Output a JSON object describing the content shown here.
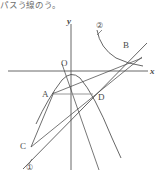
{
  "header": {
    "text": "パスう線のう。"
  },
  "figure": {
    "axes": {
      "x_label": "x",
      "y_label": "y",
      "origin_label": "O",
      "x_axis": {
        "x1": 8,
        "y1": 71,
        "x2": 148,
        "y2": 71
      },
      "y_axis": {
        "x1": 71,
        "y1": 24,
        "x2": 71,
        "y2": 170
      },
      "origin": {
        "x": 71,
        "y": 71
      }
    },
    "points": [
      {
        "name": "A",
        "label": "A",
        "x": 52,
        "y": 94,
        "label_x": 43,
        "label_y": 96
      },
      {
        "name": "B",
        "label": "B",
        "x": 131,
        "y": 52,
        "label_x": 124,
        "label_y": 47
      },
      {
        "name": "C",
        "label": "C",
        "x": 31,
        "y": 147,
        "label_x": 21,
        "label_y": 148
      },
      {
        "name": "D",
        "label": "D",
        "x": 93,
        "y": 94,
        "label_x": 99,
        "label_y": 99
      },
      {
        "name": "O",
        "label": "O",
        "x": 71,
        "y": 71,
        "label_x": 61,
        "label_y": 66
      }
    ],
    "curves": [
      {
        "name": "parabola",
        "kind": "downward-parabola",
        "path": "M 36,124 Q 48,98 62,80 Q 71,70 80,78 Q 94,94 112,138 L 121,158"
      },
      {
        "name": "curve-2",
        "kind": "hyperbola-branch",
        "path": "M 97,30 Q 100,48 116,58 Q 128,64 143,66"
      }
    ],
    "lines": [
      {
        "name": "line-1",
        "x1": 23,
        "y1": 169,
        "x2": 147,
        "y2": 43
      },
      {
        "name": "line-C-to-B",
        "x1": 31,
        "y1": 147,
        "x2": 142,
        "y2": 57
      },
      {
        "name": "line-A-to-B",
        "x1": 52,
        "y1": 94,
        "x2": 142,
        "y2": 58
      },
      {
        "name": "line-O-to-steep",
        "x1": 62,
        "y1": 64,
        "x2": 99,
        "y2": 170
      },
      {
        "name": "segment-A-D",
        "x1": 53,
        "y1": 94,
        "x2": 93,
        "y2": 94
      },
      {
        "name": "chord-C-A",
        "x1": 31,
        "y1": 147,
        "x2": 54,
        "y2": 92
      }
    ],
    "callouts": [
      {
        "name": "callout-1",
        "label": "①",
        "x": 30,
        "y": 166,
        "leader": {
          "x1": 31,
          "y1": 160,
          "x2": 28,
          "y2": 165
        }
      },
      {
        "name": "callout-2",
        "label": "②",
        "x": 100,
        "y": 25,
        "leader": {
          "x1": 102,
          "y1": 29,
          "x2": 98,
          "y2": 33
        }
      }
    ]
  },
  "colors": {
    "stroke": "#4a4a4a",
    "axis": "#555555",
    "text": "#3f3f3f",
    "background": "#ffffff"
  }
}
